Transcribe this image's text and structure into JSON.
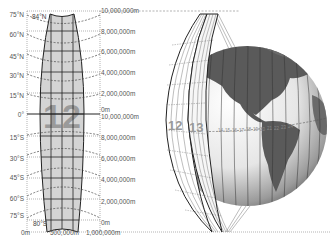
{
  "figure": {
    "zone_panel": {
      "zone_number": "12",
      "top_limit": "84°N",
      "bottom_limit": "80°S",
      "latitude_labels": [
        "75°N",
        "60°N",
        "45°N",
        "30°N",
        "15°N",
        "0°",
        "15°S",
        "30°S",
        "45°S",
        "60°S",
        "75°S"
      ],
      "northing_north": [
        "10,000,000m",
        "8,000,000m",
        "6,000,000m",
        "4,000,000m",
        "2,000,000m",
        "0m"
      ],
      "northing_south": [
        "10,000,000m",
        "8,000,000m",
        "6,000,000m",
        "4,000,000m",
        "2,000,000m",
        "0m"
      ],
      "easting_labels": [
        "0m",
        "500,000m",
        "1,000,000m"
      ]
    },
    "globe_panel": {
      "strip_labels": [
        "12",
        "13"
      ],
      "equator_zone_numbers": [
        "14",
        "15",
        "16",
        "17",
        "18",
        "19",
        "20",
        "21",
        "22",
        "23",
        "24"
      ]
    },
    "colors": {
      "zone_fill": "#d4d4d4",
      "zone_number": "#9a9a9a",
      "land": "#5a5a5a",
      "ocean_light": "#f2f2f2",
      "ocean_dark": "#7a7a7a",
      "line": "#222222",
      "dashed": "#444444"
    }
  }
}
